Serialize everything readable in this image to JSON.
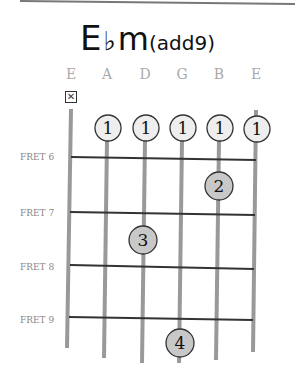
{
  "title": {
    "root": "E",
    "accidental": "♭",
    "quality": "m",
    "extension": "(add9)"
  },
  "strings": [
    "E",
    "A",
    "D",
    "G",
    "B",
    "E"
  ],
  "muted_strings": [
    0
  ],
  "mute_symbol": "☒",
  "frets": [
    "FRET 6",
    "FRET 7",
    "FRET 8",
    "FRET 9"
  ],
  "fingers": [
    {
      "string": 1,
      "pos": "top",
      "label": "1",
      "fill": "#eeeeee"
    },
    {
      "string": 2,
      "pos": "top",
      "label": "1",
      "fill": "#eeeeee"
    },
    {
      "string": 3,
      "pos": "top",
      "label": "1",
      "fill": "#eeeeee"
    },
    {
      "string": 4,
      "pos": "top",
      "label": "1",
      "fill": "#eeeeee"
    },
    {
      "string": 5,
      "pos": "top",
      "label": "1",
      "fill": "#eeeeee"
    },
    {
      "string": 4,
      "pos": "fret6-7",
      "label": "2",
      "fill": "#c8c8c8"
    },
    {
      "string": 2,
      "pos": "fret7-8",
      "label": "3",
      "fill": "#c8c8c8"
    },
    {
      "string": 3,
      "pos": "below9",
      "label": "4",
      "fill": "#c8c8c8"
    }
  ]
}
